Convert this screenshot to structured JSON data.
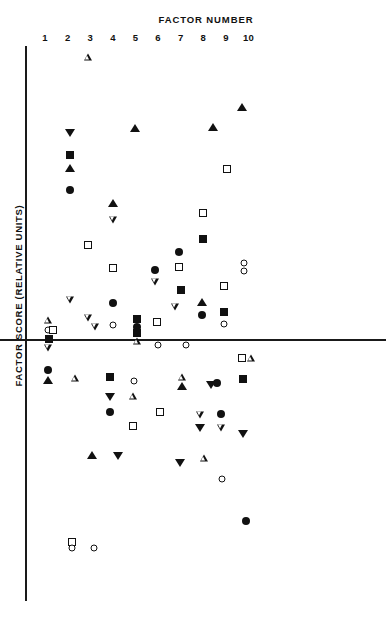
{
  "chart_data": {
    "type": "scatter",
    "title": "FACTOR NUMBER",
    "xlabel": "FACTOR NUMBER",
    "ylabel": "FACTOR SCORE (RELATIVE UNITS)",
    "grid": false,
    "legend": "none",
    "xlim": [
      0.5,
      10.5
    ],
    "xticks": [
      1,
      2,
      3,
      4,
      5,
      6,
      7,
      8,
      9,
      10
    ],
    "xtick_labels": [
      "1",
      "2",
      "3",
      "4",
      "5",
      "6",
      "7",
      "8",
      "9",
      "10"
    ],
    "zero_line_y": 0,
    "marker_types": [
      "filled-circle",
      "open-circle",
      "filled-square",
      "open-square",
      "filled-triangle",
      "open-triangle",
      "filled-dtriangle",
      "open-dtriangle"
    ],
    "axis_color": "#1a1a1a",
    "marker_color": "#111111",
    "background": "#ffffff",
    "points": [
      {
        "factor": 3,
        "px": 88,
        "py": 57,
        "marker": "open-triangle"
      },
      {
        "factor": 10,
        "px": 242,
        "py": 107,
        "marker": "filled-triangle"
      },
      {
        "factor": 4,
        "px": 135,
        "py": 128,
        "marker": "filled-triangle"
      },
      {
        "factor": 8,
        "px": 213,
        "py": 127,
        "marker": "filled-triangle"
      },
      {
        "factor": 2,
        "px": 70,
        "py": 133,
        "marker": "filled-dtriangle"
      },
      {
        "factor": 2,
        "px": 70,
        "py": 155,
        "marker": "filled-square"
      },
      {
        "factor": 2,
        "px": 70,
        "py": 168,
        "marker": "filled-triangle"
      },
      {
        "factor": 8,
        "px": 227,
        "py": 169,
        "marker": "open-square"
      },
      {
        "factor": 2,
        "px": 70,
        "py": 190,
        "marker": "filled-circle"
      },
      {
        "factor": 4,
        "px": 113,
        "py": 203,
        "marker": "filled-triangle"
      },
      {
        "factor": 8,
        "px": 203,
        "py": 213,
        "marker": "open-square"
      },
      {
        "factor": 4,
        "px": 113,
        "py": 220,
        "marker": "open-dtriangle"
      },
      {
        "factor": 8,
        "px": 203,
        "py": 239,
        "marker": "filled-square"
      },
      {
        "factor": 3,
        "px": 88,
        "py": 245,
        "marker": "open-square"
      },
      {
        "factor": 7,
        "px": 179,
        "py": 252,
        "marker": "filled-circle"
      },
      {
        "factor": 7,
        "px": 179,
        "py": 267,
        "marker": "open-square"
      },
      {
        "factor": 10,
        "px": 244,
        "py": 263,
        "marker": "open-circle"
      },
      {
        "factor": 10,
        "px": 244,
        "py": 271,
        "marker": "open-circle"
      },
      {
        "factor": 5,
        "px": 113,
        "py": 268,
        "marker": "open-square"
      },
      {
        "factor": 6,
        "px": 155,
        "py": 270,
        "marker": "filled-circle"
      },
      {
        "factor": 6,
        "px": 155,
        "py": 282,
        "marker": "open-dtriangle"
      },
      {
        "factor": 9,
        "px": 224,
        "py": 286,
        "marker": "open-square"
      },
      {
        "factor": 7,
        "px": 181,
        "py": 290,
        "marker": "filled-square"
      },
      {
        "factor": 2,
        "px": 70,
        "py": 300,
        "marker": "open-dtriangle"
      },
      {
        "factor": 5,
        "px": 113,
        "py": 303,
        "marker": "filled-circle"
      },
      {
        "factor": 8,
        "px": 202,
        "py": 302,
        "marker": "filled-triangle"
      },
      {
        "factor": 7,
        "px": 175,
        "py": 307,
        "marker": "open-dtriangle"
      },
      {
        "factor": 9,
        "px": 224,
        "py": 312,
        "marker": "filled-square"
      },
      {
        "factor": 8,
        "px": 202,
        "py": 315,
        "marker": "filled-circle"
      },
      {
        "factor": 3,
        "px": 88,
        "py": 318,
        "marker": "open-dtriangle"
      },
      {
        "factor": 1,
        "px": 48,
        "py": 320,
        "marker": "open-triangle"
      },
      {
        "factor": 6,
        "px": 137,
        "py": 319,
        "marker": "filled-square"
      },
      {
        "factor": 6,
        "px": 137,
        "py": 327,
        "marker": "filled-circle"
      },
      {
        "factor": 6,
        "px": 137,
        "py": 333,
        "marker": "filled-square"
      },
      {
        "factor": 7,
        "px": 157,
        "py": 322,
        "marker": "open-square"
      },
      {
        "factor": 9,
        "px": 224,
        "py": 324,
        "marker": "open-circle"
      },
      {
        "factor": 5,
        "px": 113,
        "py": 325,
        "marker": "open-circle"
      },
      {
        "factor": 1,
        "px": 48,
        "py": 330,
        "marker": "open-circle"
      },
      {
        "factor": 1,
        "px": 53,
        "py": 330,
        "marker": "open-square"
      },
      {
        "factor": 4,
        "px": 95,
        "py": 327,
        "marker": "open-dtriangle"
      },
      {
        "factor": 1,
        "px": 49,
        "py": 339,
        "marker": "filled-square"
      },
      {
        "factor": 6,
        "px": 137,
        "py": 341,
        "marker": "open-triangle"
      },
      {
        "factor": 7,
        "px": 158,
        "py": 345,
        "marker": "open-circle"
      },
      {
        "factor": 8,
        "px": 186,
        "py": 345,
        "marker": "open-circle"
      },
      {
        "factor": 10,
        "px": 242,
        "py": 358,
        "marker": "open-square"
      },
      {
        "factor": 10,
        "px": 251,
        "py": 358,
        "marker": "open-triangle"
      },
      {
        "factor": 1,
        "px": 48,
        "py": 348,
        "marker": "open-dtriangle"
      },
      {
        "factor": 1,
        "px": 48,
        "py": 370,
        "marker": "filled-circle"
      },
      {
        "factor": 1,
        "px": 48,
        "py": 380,
        "marker": "filled-triangle"
      },
      {
        "factor": 2,
        "px": 75,
        "py": 378,
        "marker": "open-triangle"
      },
      {
        "factor": 3,
        "px": 110,
        "py": 377,
        "marker": "filled-square"
      },
      {
        "factor": 5,
        "px": 134,
        "py": 381,
        "marker": "open-circle"
      },
      {
        "factor": 7,
        "px": 182,
        "py": 377,
        "marker": "open-triangle"
      },
      {
        "factor": 7,
        "px": 182,
        "py": 386,
        "marker": "filled-triangle"
      },
      {
        "factor": 9,
        "px": 211,
        "py": 385,
        "marker": "filled-dtriangle"
      },
      {
        "factor": 9,
        "px": 217,
        "py": 383,
        "marker": "filled-circle"
      },
      {
        "factor": 10,
        "px": 243,
        "py": 379,
        "marker": "filled-square"
      },
      {
        "factor": 3,
        "px": 110,
        "py": 397,
        "marker": "filled-dtriangle"
      },
      {
        "factor": 4,
        "px": 133,
        "py": 396,
        "marker": "open-triangle"
      },
      {
        "factor": 3,
        "px": 110,
        "py": 412,
        "marker": "filled-circle"
      },
      {
        "factor": 6,
        "px": 160,
        "py": 412,
        "marker": "open-square"
      },
      {
        "factor": 8,
        "px": 200,
        "py": 415,
        "marker": "open-dtriangle"
      },
      {
        "factor": 9,
        "px": 221,
        "py": 414,
        "marker": "filled-circle"
      },
      {
        "factor": 4,
        "px": 133,
        "py": 426,
        "marker": "open-square"
      },
      {
        "factor": 8,
        "px": 200,
        "py": 428,
        "marker": "filled-dtriangle"
      },
      {
        "factor": 9,
        "px": 221,
        "py": 428,
        "marker": "open-dtriangle"
      },
      {
        "factor": 10,
        "px": 243,
        "py": 434,
        "marker": "filled-dtriangle"
      },
      {
        "factor": 3,
        "px": 92,
        "py": 455,
        "marker": "filled-triangle"
      },
      {
        "factor": 4,
        "px": 118,
        "py": 456,
        "marker": "filled-dtriangle"
      },
      {
        "factor": 7,
        "px": 180,
        "py": 463,
        "marker": "filled-dtriangle"
      },
      {
        "factor": 8,
        "px": 204,
        "py": 458,
        "marker": "open-triangle"
      },
      {
        "factor": 9,
        "px": 222,
        "py": 479,
        "marker": "open-circle"
      },
      {
        "factor": 10,
        "px": 246,
        "py": 521,
        "marker": "filled-circle"
      },
      {
        "factor": 2,
        "px": 72,
        "py": 542,
        "marker": "open-square"
      },
      {
        "factor": 2,
        "px": 72,
        "py": 548,
        "marker": "open-circle"
      },
      {
        "factor": 3,
        "px": 94,
        "py": 548,
        "marker": "open-circle"
      }
    ]
  }
}
